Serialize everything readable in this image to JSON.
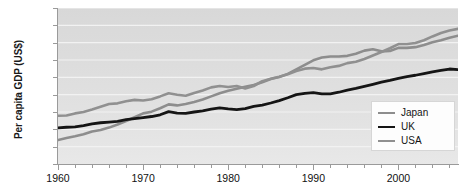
{
  "chart_data": {
    "type": "line",
    "title": "",
    "subtitle": "",
    "xlabel": "",
    "ylabel": "Per capita GDP (US$)",
    "xlim": [
      1960,
      2007
    ],
    "ylim": [
      0,
      45000
    ],
    "grid": true,
    "grid_axis": "y",
    "legend_position": "bottom-right",
    "y_ticks": [
      0,
      5000,
      10000,
      15000,
      20000,
      25000,
      30000,
      35000,
      40000,
      45000
    ],
    "y_tick_labels": [
      "0",
      "5000",
      "10 000",
      "15 000",
      "20 000",
      "25 000",
      "30 000",
      "35 000",
      "40 000",
      "45 000"
    ],
    "x_ticks": [
      1960,
      1970,
      1980,
      1990,
      2000
    ],
    "x_tick_labels": [
      "1960",
      "1970",
      "1980",
      "1990",
      "2000"
    ],
    "x_minor_tick_step": 2,
    "x": [
      1960,
      1961,
      1962,
      1963,
      1964,
      1965,
      1966,
      1967,
      1968,
      1969,
      1970,
      1971,
      1972,
      1973,
      1974,
      1975,
      1976,
      1977,
      1978,
      1979,
      1980,
      1981,
      1982,
      1983,
      1984,
      1985,
      1986,
      1987,
      1988,
      1989,
      1990,
      1991,
      1992,
      1993,
      1994,
      1995,
      1996,
      1997,
      1998,
      1999,
      2000,
      2001,
      2002,
      2003,
      2004,
      2005,
      2006,
      2007
    ],
    "series": [
      {
        "name": "Japan",
        "color": "#8d8d8d",
        "width": 2.6,
        "values": [
          6900,
          7500,
          8000,
          8600,
          9400,
          9800,
          10500,
          11400,
          12400,
          13500,
          14600,
          15100,
          16100,
          17200,
          16900,
          17300,
          17900,
          18600,
          19500,
          20400,
          21100,
          21700,
          22300,
          22800,
          23600,
          24500,
          25100,
          26000,
          27300,
          28600,
          29900,
          30700,
          31000,
          31000,
          31200,
          31800,
          32700,
          33100,
          32500,
          32600,
          33500,
          33500,
          33700,
          34300,
          35100,
          35700,
          36400,
          37000
        ]
      },
      {
        "name": "UK",
        "color": "#151515",
        "width": 2.8,
        "values": [
          10400,
          10600,
          10700,
          11100,
          11600,
          11900,
          12100,
          12300,
          12800,
          13100,
          13400,
          13700,
          14200,
          15100,
          14700,
          14600,
          15000,
          15300,
          15800,
          16200,
          15900,
          15700,
          16000,
          16600,
          17000,
          17600,
          18300,
          19100,
          20000,
          20400,
          20600,
          20200,
          20200,
          20700,
          21300,
          21800,
          22400,
          23000,
          23600,
          24100,
          24700,
          25200,
          25600,
          26100,
          26600,
          27000,
          27400,
          27200
        ]
      },
      {
        "name": "USA",
        "color": "#909090",
        "width": 2.6,
        "values": [
          13900,
          14000,
          14600,
          15000,
          15700,
          16500,
          17300,
          17500,
          18100,
          18500,
          18300,
          18700,
          19500,
          20400,
          20000,
          19700,
          20500,
          21200,
          22100,
          22500,
          22200,
          22500,
          21800,
          22500,
          23900,
          24600,
          25200,
          25900,
          26800,
          27500,
          27700,
          27300,
          27900,
          28300,
          29100,
          29500,
          30300,
          31300,
          32300,
          33400,
          34600,
          34600,
          34900,
          35700,
          36800,
          37800,
          38500,
          39000
        ]
      }
    ]
  }
}
